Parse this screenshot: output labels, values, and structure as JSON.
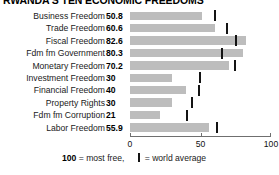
{
  "title": "RWANDA'S TEN ECONOMIC FREEDOMS",
  "legend": {
    "scale_note_value": "100",
    "scale_note_text": " = most free,",
    "world_average_text": " = world average"
  },
  "axis": {
    "labels": [
      "0",
      "50",
      "100"
    ],
    "min": 0,
    "max": 100
  },
  "chart_data": {
    "type": "bar",
    "orientation": "horizontal",
    "title": "RWANDA'S TEN ECONOMIC FREEDOMS",
    "xlabel": "",
    "ylabel": "",
    "xlim": [
      0,
      100
    ],
    "xticks": [
      0,
      50,
      100
    ],
    "grid": false,
    "legend_position": "bottom",
    "bar_color": "#bdbdbd",
    "marker_color": "#141414",
    "categories": [
      "Business Freedom",
      "Trade Freedom",
      "Fiscal Freedom",
      "Fdm fm Government",
      "Monetary Freedom",
      "Investment Freedom",
      "Financial Freedom",
      "Property Rights",
      "Fdm fm Corruption",
      "Labor Freedom"
    ],
    "values": [
      50.8,
      60.6,
      82.6,
      80.3,
      70.2,
      30,
      40,
      30,
      21,
      55.9
    ],
    "value_labels": [
      "50.8",
      "60.6",
      "82.6",
      "80.3",
      "70.2",
      "30",
      "40",
      "30",
      "21",
      "55.9"
    ],
    "world_average": [
      60.2,
      68.8,
      74.9,
      65.0,
      74.2,
      49.6,
      49.1,
      43.8,
      40.5,
      61.5
    ],
    "series": [
      {
        "name": "Rwanda score",
        "values": [
          50.8,
          60.6,
          82.6,
          80.3,
          70.2,
          30,
          40,
          30,
          21,
          55.9
        ]
      },
      {
        "name": "world average",
        "values": [
          60.2,
          68.8,
          74.9,
          65.0,
          74.2,
          49.6,
          49.1,
          43.8,
          40.5,
          61.5
        ]
      }
    ]
  }
}
